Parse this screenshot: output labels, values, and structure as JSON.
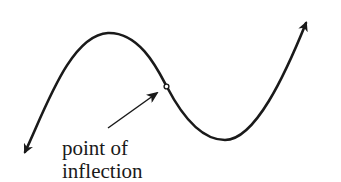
{
  "diagram": {
    "type": "cubic-curve-inflection",
    "curve": {
      "description": "S-shaped cubic curve with arrows at both ends",
      "stroke_color": "#1a1a1a",
      "left_end": "arrow pointing down-left",
      "right_end": "arrow pointing up-right",
      "local_max": "upper-left hump",
      "local_min": "lower-right valley"
    },
    "inflection_point": {
      "marker": "small open circle",
      "label_line1": "point of",
      "label_line2": "inflection"
    }
  }
}
